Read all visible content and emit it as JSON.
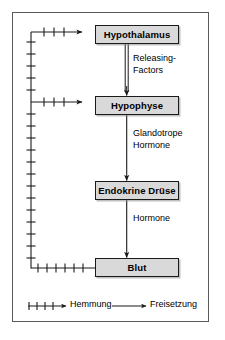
{
  "diagram": {
    "type": "flow-feedback-loop",
    "colors": {
      "box_fill": "#d9d9d9",
      "box_border": "#1a1a1a",
      "frame_border": "#5a5a5a",
      "line": "#1a1a1a",
      "background": "#ffffff"
    },
    "nodes": [
      {
        "id": "hypothalamus",
        "label": "Hypothalamus"
      },
      {
        "id": "hypophyse",
        "label": "Hypophyse"
      },
      {
        "id": "endokrine_druese",
        "label": "Endokrine Drüse"
      },
      {
        "id": "blut",
        "label": "Blut"
      }
    ],
    "edges": [
      {
        "id": "e1",
        "from": "hypothalamus",
        "to": "hypophyse",
        "label": "Releasing-\nFactors",
        "kind": "freisetzung",
        "style": "double-line"
      },
      {
        "id": "e2",
        "from": "hypophyse",
        "to": "endokrine_druese",
        "label": "Glandotrope\nHormone",
        "kind": "freisetzung",
        "style": "single-line"
      },
      {
        "id": "e3",
        "from": "endokrine_druese",
        "to": "blut",
        "label": "Hormone",
        "kind": "freisetzung",
        "style": "single-line"
      },
      {
        "id": "f1",
        "from": "blut",
        "to": "hypothalamus",
        "label": "",
        "kind": "hemmung",
        "style": "ticked-line"
      },
      {
        "id": "f2",
        "from": "blut",
        "to": "hypophyse",
        "label": "",
        "kind": "hemmung",
        "style": "ticked-line"
      }
    ],
    "legend": {
      "items": [
        {
          "id": "hemmung",
          "label": "Hemmung",
          "marker": "ticked-arrow"
        },
        {
          "id": "freisetzung",
          "label": "Freisetzung",
          "marker": "plain-arrow"
        }
      ]
    }
  }
}
